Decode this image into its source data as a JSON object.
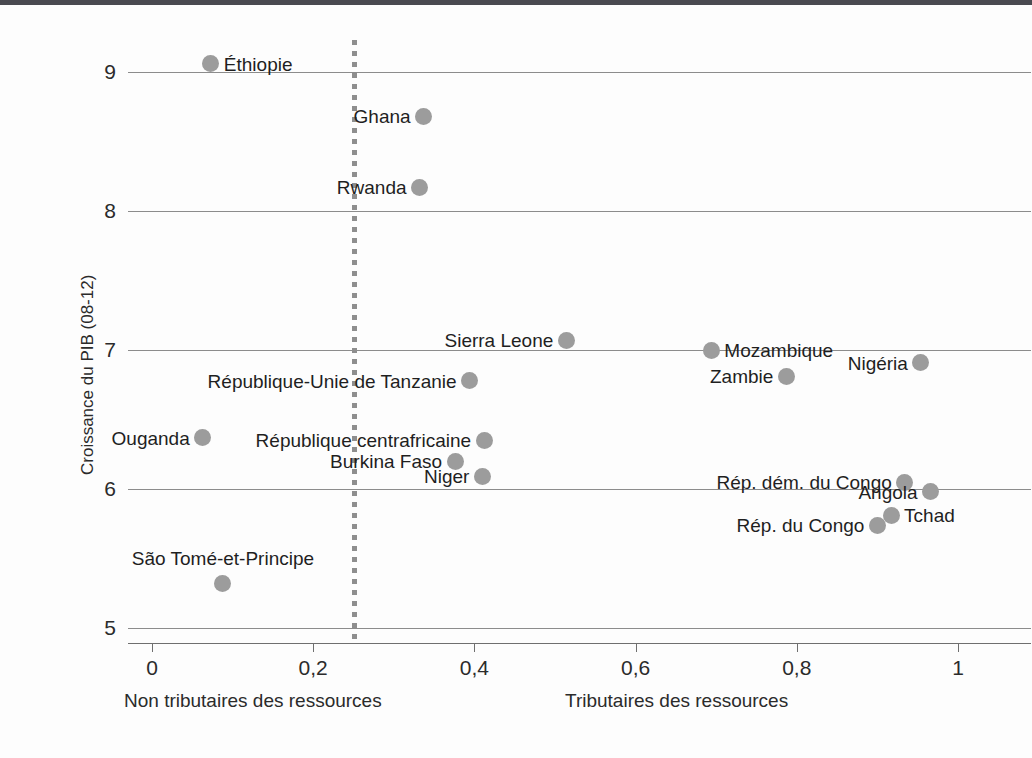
{
  "chart_data": {
    "type": "scatter",
    "title": "",
    "xlabel": "",
    "ylabel": "Croissance du PIB (08-12)",
    "xlim": [
      -0.03,
      1.09
    ],
    "ylim": [
      4.75,
      9.3
    ],
    "xticks": [
      0,
      0.2,
      0.4,
      0.6,
      0.8,
      1
    ],
    "xticklabels": [
      "0",
      "0,2",
      "0,4",
      "0,6",
      "0,8",
      "1"
    ],
    "yticks": [
      5,
      6,
      7,
      8,
      9
    ],
    "yticklabels": [
      "5",
      "6",
      "7",
      "8",
      "9"
    ],
    "grid": "horizontal",
    "legend": "none",
    "annotations": {
      "threshold_line_x": 0.25,
      "left_group_label": "Non tributaires des ressources",
      "right_group_label": "Tributaires des ressources"
    },
    "points": [
      {
        "label": "Éthiopie",
        "x": 0.073,
        "y": 9.06,
        "label_side": "right"
      },
      {
        "label": "Ghana",
        "x": 0.337,
        "y": 8.68,
        "label_side": "left"
      },
      {
        "label": "Rwanda",
        "x": 0.332,
        "y": 8.17,
        "label_side": "left"
      },
      {
        "label": "Sierra Leone",
        "x": 0.514,
        "y": 7.07,
        "label_side": "left"
      },
      {
        "label": "Mozambique",
        "x": 0.694,
        "y": 7.0,
        "label_side": "right"
      },
      {
        "label": "Nigéria",
        "x": 0.954,
        "y": 6.91,
        "label_side": "left"
      },
      {
        "label": "Zambie",
        "x": 0.787,
        "y": 6.81,
        "label_side": "left"
      },
      {
        "label": "République-Unie de Tanzanie",
        "x": 0.394,
        "y": 6.78,
        "label_side": "left"
      },
      {
        "label": "Ouganda",
        "x": 0.063,
        "y": 6.37,
        "label_side": "left"
      },
      {
        "label": "République centrafricaine",
        "x": 0.412,
        "y": 6.35,
        "label_side": "left"
      },
      {
        "label": "Burkina Faso",
        "x": 0.376,
        "y": 6.2,
        "label_side": "left"
      },
      {
        "label": "Niger",
        "x": 0.41,
        "y": 6.09,
        "label_side": "left"
      },
      {
        "label": "Rép. dém. du Congo",
        "x": 0.934,
        "y": 6.05,
        "label_side": "left"
      },
      {
        "label": "Angola",
        "x": 0.966,
        "y": 5.98,
        "label_side": "left"
      },
      {
        "label": "Tchad",
        "x": 0.917,
        "y": 5.81,
        "label_side": "right"
      },
      {
        "label": "Rép. du Congo",
        "x": 0.9,
        "y": 5.74,
        "label_side": "left"
      },
      {
        "label": "São Tomé-et-Principe",
        "x": 0.088,
        "y": 5.32,
        "label_side": "top"
      }
    ],
    "colors": {
      "point": "#9c9c9c",
      "gridline": "#8c8c8c",
      "threshold": "#8e8e8e",
      "text": "#1f1f1f",
      "background": "#fdfdfd"
    }
  }
}
